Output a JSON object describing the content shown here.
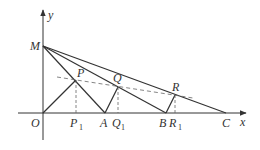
{
  "diagram": {
    "colors": {
      "line": "#333333",
      "dashed": "#666666",
      "background": "#ffffff"
    },
    "axes": {
      "x_label": "x",
      "y_label": "y",
      "origin_label": "O"
    },
    "points": {
      "M": {
        "label": "M",
        "x": 43,
        "y": 46
      },
      "O": {
        "label": "O",
        "x": 43,
        "y": 113
      },
      "A": {
        "label": "A",
        "x": 105,
        "y": 113
      },
      "B": {
        "label": "B",
        "x": 166,
        "y": 113
      },
      "C": {
        "label": "C",
        "x": 226,
        "y": 113
      },
      "P": {
        "label": "P",
        "x": 76,
        "y": 80
      },
      "Q": {
        "label": "Q",
        "x": 118,
        "y": 87
      },
      "R": {
        "label": "R",
        "x": 175,
        "y": 95
      },
      "P1": {
        "label": "P",
        "sub": "1",
        "x": 76,
        "y": 113
      },
      "Q1": {
        "label": "Q",
        "sub": "1",
        "x": 118,
        "y": 113
      },
      "R1": {
        "label": "R",
        "sub": "1",
        "x": 175,
        "y": 113
      }
    },
    "segments_solid": [
      "M-A",
      "M-B",
      "M-C",
      "O-P",
      "A-Q",
      "B-R"
    ],
    "segments_dashed": [
      "P-P1",
      "Q-Q1",
      "R-R1",
      "dashed line through P, Q, R"
    ]
  }
}
